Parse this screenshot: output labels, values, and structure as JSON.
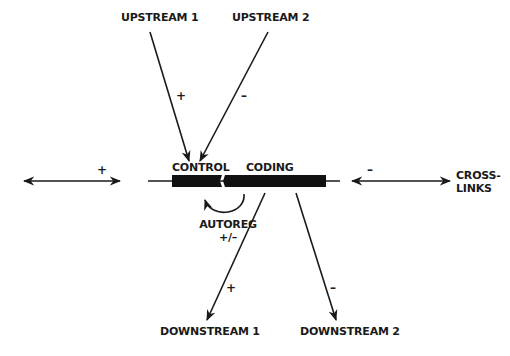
{
  "diagram": {
    "type": "gene-regulation-schematic",
    "gene": {
      "segments": [
        {
          "id": "control",
          "label": "CONTROL"
        },
        {
          "id": "coding",
          "label": "CODING"
        }
      ]
    },
    "nodes": {
      "upstream_1": "UPSTREAM 1",
      "upstream_2": "UPSTREAM 2",
      "downstream_1": "DOWNSTREAM 1",
      "downstream_2": "DOWNSTREAM 2",
      "autoreg": "AUTOREG",
      "autoreg_sign": "+/–",
      "crosslinks_line1": "CROSS-",
      "crosslinks_line2": "LINKS"
    },
    "edges": [
      {
        "from": "UPSTREAM 1",
        "to": "CONTROL",
        "sign": "+"
      },
      {
        "from": "UPSTREAM 2",
        "to": "CONTROL",
        "sign": "–"
      },
      {
        "from": "CODING",
        "to": "DOWNSTREAM 1",
        "sign": "+"
      },
      {
        "from": "CODING",
        "to": "DOWNSTREAM 2",
        "sign": "–"
      },
      {
        "from": "CODING",
        "to": "CONTROL",
        "sign": "+/–",
        "label": "AUTOREG"
      },
      {
        "from": "left",
        "to": "gene",
        "sign": "+",
        "bidirectional": true
      },
      {
        "from": "gene",
        "to": "CROSS-LINKS",
        "sign": "–",
        "bidirectional": true
      }
    ],
    "signs": {
      "upstream_1": "+",
      "upstream_2": "–",
      "downstream_1": "+",
      "downstream_2": "–",
      "left_link": "+",
      "right_link": "–"
    }
  }
}
